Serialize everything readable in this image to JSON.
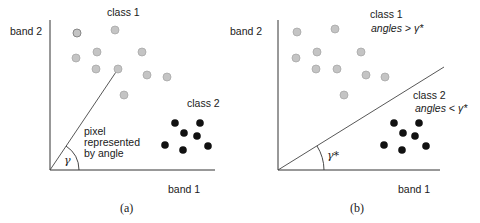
{
  "figure": {
    "panels": [
      {
        "id": "a",
        "caption": "(a)",
        "y_axis_label": "band 2",
        "x_axis_label": "band 1",
        "class1_label": "class 1",
        "class2_label": "class 2",
        "annotation_lines": [
          "pixel",
          "represented",
          "by angle"
        ],
        "angle_symbol": "γ"
      },
      {
        "id": "b",
        "caption": "(b)",
        "y_axis_label": "band 2",
        "x_axis_label": "band 1",
        "class1_label": "class 1",
        "class1_rule_word": "angles",
        "class1_rule_rest": " > γ*",
        "class2_label": "class 2",
        "class2_rule_word": "angles",
        "class2_rule_rest": " < γ*",
        "angle_symbol": "γ*"
      }
    ],
    "colors": {
      "class1_fill": "#c4c4c4",
      "class1_stroke": "#a8a8a8",
      "class2_fill": "#111111",
      "axis": "#333333"
    }
  }
}
